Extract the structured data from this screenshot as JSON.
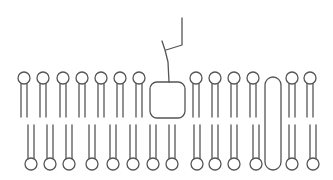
{
  "diagram": {
    "title": "",
    "type": "cell-membrane-lipid-bilayer",
    "colors": {
      "line": "#555555",
      "background": "#ffffff"
    },
    "phospholipid": {
      "head_radius": 6,
      "tail_gap": 6
    },
    "outer_leaflet": {
      "head_y": 78,
      "tail_end_y": 117,
      "head_x": [
        24,
        43,
        63,
        82,
        101,
        120,
        139,
        196,
        215,
        234,
        253,
        292,
        310
      ]
    },
    "inner_leaflet": {
      "head_y": 164,
      "tail_start_y": 125,
      "head_x": [
        31,
        50,
        69,
        92,
        113,
        133,
        153,
        172,
        197,
        215,
        234,
        256,
        292,
        313
      ]
    },
    "peripheral_glycoprotein": {
      "box": {
        "x": 150,
        "y": 82,
        "width": 35,
        "height": 36,
        "rx": 7
      },
      "carbohydrate_chain": {
        "stem": [
          [
            169,
            82
          ],
          [
            168,
            62
          ],
          [
            165,
            50
          ],
          [
            162,
            41
          ]
        ],
        "branch": [
          [
            166,
            50
          ],
          [
            182,
            45
          ],
          [
            182,
            18
          ]
        ]
      }
    },
    "transmembrane_protein": {
      "x": 265,
      "y": 77,
      "width": 16,
      "height": 93,
      "rx": 8
    }
  }
}
